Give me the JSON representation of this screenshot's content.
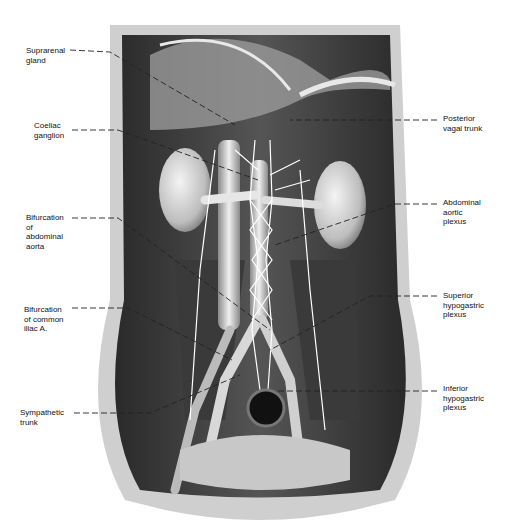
{
  "figure": {
    "labels_left": [
      {
        "id": "suprarenal-gland",
        "text": "Suprarenal\ngland",
        "x": 26,
        "y": 46,
        "line": [
          [
            70,
            50
          ],
          [
            110,
            52
          ],
          [
            235,
            125
          ]
        ]
      },
      {
        "id": "coeliac-ganglion",
        "text": "Coeliac\nganglion",
        "x": 34,
        "y": 121,
        "line": [
          [
            72,
            130
          ],
          [
            118,
            130
          ],
          [
            258,
            180
          ]
        ]
      },
      {
        "id": "bifurcation-abdominal-aorta",
        "text": "Bifurcation\nof\nabdominal\naorta",
        "x": 26,
        "y": 213,
        "line": [
          [
            72,
            218
          ],
          [
            118,
            218
          ],
          [
            270,
            330
          ]
        ]
      },
      {
        "id": "bifurcation-common-iliac",
        "text": "Bifurcation\nof common\niliac A.",
        "x": 24,
        "y": 305,
        "line": [
          [
            72,
            308
          ],
          [
            128,
            308
          ],
          [
            232,
            360
          ]
        ]
      },
      {
        "id": "sympathetic-trunk",
        "text": "Sympathetic\ntrunk",
        "x": 20,
        "y": 408,
        "line": [
          [
            74,
            413
          ],
          [
            150,
            413
          ],
          [
            240,
            375
          ]
        ]
      }
    ],
    "labels_right": [
      {
        "id": "posterior-vagal-trunk",
        "text": "Posterior\nvagal trunk",
        "x": 443,
        "y": 114,
        "line": [
          [
            437,
            120
          ],
          [
            290,
            120
          ]
        ]
      },
      {
        "id": "abdominal-aortic-plexus",
        "text": "Abdominal\naortic\nplexus",
        "x": 443,
        "y": 198,
        "line": [
          [
            437,
            204
          ],
          [
            395,
            204
          ],
          [
            275,
            245
          ]
        ]
      },
      {
        "id": "superior-hypogastric-plexus",
        "text": "Superior\nhypogastric\nplexus",
        "x": 443,
        "y": 291,
        "line": [
          [
            437,
            296
          ],
          [
            370,
            296
          ],
          [
            270,
            350
          ]
        ]
      },
      {
        "id": "inferior-hypogastric-plexus",
        "text": "Inferior\nhypogastric\nplexus",
        "x": 443,
        "y": 384,
        "line": [
          [
            437,
            391
          ],
          [
            275,
            391
          ]
        ]
      }
    ]
  }
}
